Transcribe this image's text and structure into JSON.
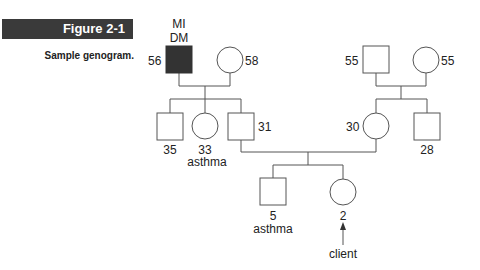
{
  "figure": {
    "label": "Figure 2-1",
    "caption": "Sample genogram."
  },
  "genogram": {
    "generation1": {
      "paternal_grandfather": {
        "sex": "male",
        "age": "56",
        "conditions": [
          "MI",
          "DM"
        ],
        "affected": true
      },
      "paternal_grandmother": {
        "sex": "female",
        "age": "58"
      },
      "maternal_grandfather": {
        "sex": "male",
        "age": "55"
      },
      "maternal_grandmother": {
        "sex": "female",
        "age": "55"
      }
    },
    "generation2": {
      "uncle": {
        "sex": "male",
        "age": "35"
      },
      "aunt": {
        "sex": "female",
        "age": "33",
        "condition": "asthma"
      },
      "father": {
        "sex": "male",
        "age": "31"
      },
      "mother": {
        "sex": "female",
        "age": "30"
      },
      "maternal_uncle": {
        "sex": "male",
        "age": "28"
      }
    },
    "generation3": {
      "brother": {
        "sex": "male",
        "age": "5",
        "condition": "asthma"
      },
      "client": {
        "sex": "female",
        "age": "2",
        "label": "client"
      }
    }
  },
  "colors": {
    "line": "#555555",
    "affected_fill": "#333333",
    "banner_bg": "#3a3a3a"
  }
}
